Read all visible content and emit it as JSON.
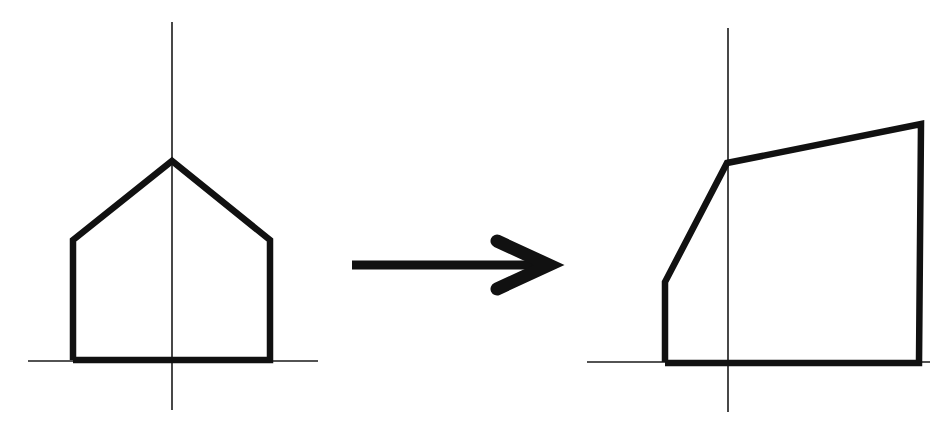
{
  "canvas": {
    "width": 952,
    "height": 433,
    "background_color": "#ffffff",
    "ink_color": "#111111",
    "axis_color": "#1a1a1a"
  },
  "figure": {
    "type": "geometric-transformation-diagram",
    "panels": [
      {
        "id": "source-shape",
        "role": "before",
        "shape_name": "house-pentagon",
        "axes": {
          "x_axis": {
            "x1": 28,
            "y1": 361,
            "x2": 318,
            "y2": 361
          },
          "y_axis": {
            "x1": 172,
            "y1": 22,
            "x2": 172,
            "y2": 410
          }
        },
        "origin": {
          "x": 172,
          "y": 361
        },
        "outline_points": "73,360 73,240 172,161 270,240 270,360 73,360",
        "vertices": [
          {
            "name": "bottom-left",
            "x": 73,
            "y": 360
          },
          {
            "name": "left-shoulder",
            "x": 73,
            "y": 240
          },
          {
            "name": "apex",
            "x": 172,
            "y": 161
          },
          {
            "name": "right-shoulder",
            "x": 270,
            "y": 240
          },
          {
            "name": "bottom-right",
            "x": 270,
            "y": 360
          }
        ]
      },
      {
        "id": "target-shape",
        "role": "after",
        "shape_name": "sheared-pentagon",
        "axes": {
          "x_axis": {
            "x1": 587,
            "y1": 362,
            "x2": 930,
            "y2": 362
          },
          "y_axis": {
            "x1": 728,
            "y1": 28,
            "x2": 728,
            "y2": 412
          }
        },
        "origin": {
          "x": 728,
          "y": 362
        },
        "outline_points": "665,362 665,282 727,163 921,124 919,363 665,363",
        "vertices": [
          {
            "name": "bottom-left",
            "x": 665,
            "y": 362
          },
          {
            "name": "left-knee",
            "x": 665,
            "y": 282
          },
          {
            "name": "apex-kink",
            "x": 727,
            "y": 163
          },
          {
            "name": "top-right",
            "x": 921,
            "y": 124
          },
          {
            "name": "bottom-right",
            "x": 919,
            "y": 363
          }
        ]
      }
    ],
    "arrow": {
      "id": "transformation-arrow",
      "direction": "right",
      "shaft": {
        "x1": 352,
        "y1": 265,
        "x2": 540,
        "y2": 265
      },
      "head": "497,241 549,265 497,289"
    }
  }
}
